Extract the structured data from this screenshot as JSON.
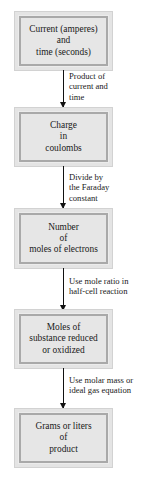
{
  "diagram": {
    "type": "flowchart",
    "direction": "top-to-bottom",
    "nodes": [
      {
        "id": "current_time",
        "label": "Current (amperes)\nand\ntime (seconds)"
      },
      {
        "id": "charge",
        "label": "Charge\nin\ncoulombs"
      },
      {
        "id": "moles_electrons",
        "label": "Number\nof\nmoles of electrons"
      },
      {
        "id": "moles_substance",
        "label": "Moles of\nsubstance reduced\nor oxidized"
      },
      {
        "id": "product",
        "label": "Grams or liters\nof\nproduct"
      }
    ],
    "edges": [
      {
        "from": "current_time",
        "to": "charge",
        "label": "Product of\ncurrent and\ntime"
      },
      {
        "from": "charge",
        "to": "moles_electrons",
        "label": "Divide by\nthe Faraday\nconstant"
      },
      {
        "from": "moles_electrons",
        "to": "moles_substance",
        "label": "Use mole ratio in\nhalf-cell reaction"
      },
      {
        "from": "moles_substance",
        "to": "product",
        "label": "Use molar mass or\nideal gas equation"
      }
    ],
    "colors": {
      "box_fill": "#e6e6e6",
      "box_border": "#a9a9a9",
      "box_frame": "#e4e4e4",
      "arrow": "#111111"
    }
  }
}
